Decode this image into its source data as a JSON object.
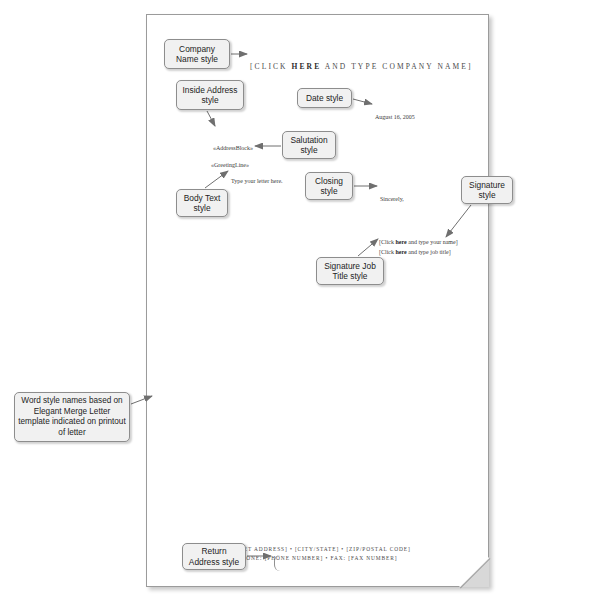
{
  "figure": {
    "note": {
      "text": "Word style names based on Elegant Merge Letter template indicated on printout of letter"
    }
  },
  "letter": {
    "company_name_pre": "[CLICK ",
    "company_name_bold": "HERE",
    "company_name_post": " AND TYPE COMPANY NAME]",
    "date": "August 16, 2005",
    "address_block": "«AddressBlock»",
    "greeting_line": "«GreetingLine»",
    "body_text": "Type your letter here.",
    "closing": "Sincerely,",
    "signature_name_pre": "[Click ",
    "signature_name_bold": "here",
    "signature_name_post": " and type your name]",
    "signature_title_pre": "[Click ",
    "signature_title_bold": "here",
    "signature_title_post": " and type job title]",
    "return_address_line1": "[STREET ADDRESS] • [CITY/STATE] • [ZIP/POSTAL CODE]",
    "return_address_line2": "PHONE: [PHONE NUMBER] • FAX: [FAX NUMBER]"
  },
  "labels": {
    "company_name_style": "Company Name style",
    "inside_address_style": "Inside Address style",
    "date_style": "Date style",
    "salutation_style": "Salutation style",
    "body_text_style": "Body Text style",
    "closing_style": "Closing style",
    "signature_style": "Signature style",
    "signature_job_title_style": "Signature Job Title style",
    "return_address_style": "Return Address style"
  },
  "colors": {
    "label_fill": "#f1f1f1",
    "label_border": "#8d8d8d",
    "page_border": "#9b9b9b",
    "text": "#3b3b3b",
    "arrow": "#6f6f6f"
  }
}
